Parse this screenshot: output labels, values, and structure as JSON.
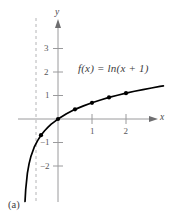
{
  "figure": {
    "panel_label": "(a)",
    "equation_label": "f(x) = ln(x + 1)",
    "background_color": "#ffffff"
  },
  "axes": {
    "x_name": "x",
    "y_name": "y",
    "axis_color": "#9a9a9c",
    "origin_px": {
      "x": 58,
      "y": 119
    },
    "px_per_unit_x": 34,
    "px_per_unit_y": 23.5,
    "x_tick_labels": [
      "1",
      "2"
    ],
    "y_tick_labels": [
      "3",
      "2",
      "1",
      "−1",
      "−2"
    ]
  },
  "asymptote": {
    "label": "x = -1",
    "style": "dashed",
    "color": "#b4b4b6"
  },
  "chart_data": {
    "type": "line",
    "title": "",
    "subtitle": "",
    "xlabel": "x",
    "ylabel": "y",
    "annotations": [
      "f(x) = ln(x + 1)",
      "(a)"
    ],
    "legend": [],
    "legend_position": "none",
    "grid": false,
    "xlim": [
      -1.3,
      3.2
    ],
    "ylim": [
      -2.6,
      3.6
    ],
    "xticks": [
      1,
      2
    ],
    "yticks": [
      3,
      2,
      1,
      -1,
      -2
    ],
    "curve_color": "#000000",
    "marker_color": "#000000",
    "vertical_asymptote": -1,
    "series": [
      {
        "name": "f(x) = ln(x + 1)",
        "function": "ln(x + 1)",
        "x": [
          -0.97,
          -0.95,
          -0.9,
          -0.85,
          -0.8,
          -0.7,
          -0.6,
          -0.5,
          -0.4,
          -0.3,
          -0.2,
          -0.1,
          0,
          0.25,
          0.5,
          0.75,
          1,
          1.25,
          1.5,
          1.75,
          2,
          2.25,
          2.5,
          2.75,
          3,
          3.1
        ],
        "y": [
          -3.51,
          -3.0,
          -2.3,
          -1.9,
          -1.61,
          -1.2,
          -0.92,
          -0.69,
          -0.51,
          -0.36,
          -0.22,
          -0.11,
          0,
          0.22,
          0.41,
          0.56,
          0.69,
          0.81,
          0.92,
          1.01,
          1.1,
          1.18,
          1.25,
          1.32,
          1.39,
          1.41
        ]
      }
    ],
    "markers": [
      {
        "x": -0.5,
        "y": -0.69
      },
      {
        "x": 0,
        "y": 0
      },
      {
        "x": 0.5,
        "y": 0.41
      },
      {
        "x": 1,
        "y": 0.69
      },
      {
        "x": 1.5,
        "y": 0.92
      },
      {
        "x": 2,
        "y": 1.1
      }
    ]
  }
}
